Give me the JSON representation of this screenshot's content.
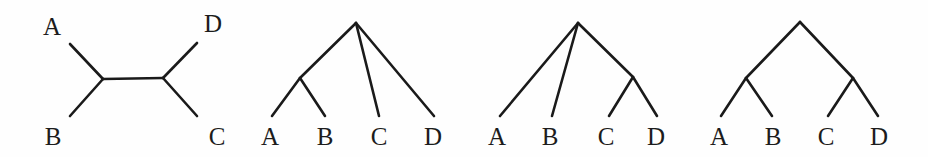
{
  "figure": {
    "name": "four-taxon-tree-diagrams",
    "background_color": "#fefefe",
    "line_color": "#1a1a1a",
    "label_color": "#1c1c1c",
    "width": 928,
    "height": 157
  },
  "trees": [
    {
      "id": "tree-unrooted",
      "type": "unrooted-four-taxon-tree",
      "description": "Unrooted tree with internal edge separating (A,B) from (C,D)",
      "labels": [
        {
          "text": "A",
          "x": 52,
          "y": 35
        },
        {
          "text": "B",
          "x": 53,
          "y": 145
        },
        {
          "text": "D",
          "x": 213,
          "y": 32
        },
        {
          "text": "C",
          "x": 217,
          "y": 145
        }
      ],
      "nodes": [
        {
          "name": "internal-left",
          "x": 103,
          "y": 79
        },
        {
          "name": "internal-right",
          "x": 163,
          "y": 78
        }
      ],
      "edges": [
        {
          "name": "edge-A",
          "x1": 70,
          "y1": 44,
          "x2": 103,
          "y2": 79
        },
        {
          "name": "edge-B",
          "x1": 70,
          "y1": 116,
          "x2": 103,
          "y2": 79
        },
        {
          "name": "edge-internal",
          "x1": 103,
          "y1": 79,
          "x2": 163,
          "y2": 78
        },
        {
          "name": "edge-D",
          "x1": 163,
          "y1": 78,
          "x2": 197,
          "y2": 43
        },
        {
          "name": "edge-C",
          "x1": 163,
          "y1": 78,
          "x2": 197,
          "y2": 116
        }
      ]
    },
    {
      "id": "tree-rooted-ab",
      "type": "rooted-four-taxon-tree",
      "description": "Rooted tree with (A,B) clade; C and D attach directly to root",
      "labels": [
        {
          "text": "A",
          "x": 270,
          "y": 145
        },
        {
          "text": "B",
          "x": 325,
          "y": 145
        },
        {
          "text": "C",
          "x": 379,
          "y": 145
        },
        {
          "text": "D",
          "x": 433,
          "y": 145
        }
      ],
      "nodes": [
        {
          "name": "root",
          "x": 356,
          "y": 23
        },
        {
          "name": "internal-ab",
          "x": 300,
          "y": 78
        }
      ],
      "edges": [
        {
          "name": "edge-root-ab",
          "x1": 356,
          "y1": 23,
          "x2": 300,
          "y2": 78
        },
        {
          "name": "edge-A",
          "x1": 300,
          "y1": 78,
          "x2": 272,
          "y2": 116
        },
        {
          "name": "edge-B",
          "x1": 300,
          "y1": 78,
          "x2": 325,
          "y2": 116
        },
        {
          "name": "edge-C",
          "x1": 356,
          "y1": 23,
          "x2": 379,
          "y2": 116
        },
        {
          "name": "edge-D",
          "x1": 356,
          "y1": 23,
          "x2": 434,
          "y2": 116
        }
      ]
    },
    {
      "id": "tree-rooted-cd",
      "type": "rooted-four-taxon-tree",
      "description": "Rooted tree with (C,D) clade; A and B attach directly to root",
      "labels": [
        {
          "text": "A",
          "x": 497,
          "y": 145
        },
        {
          "text": "B",
          "x": 550,
          "y": 145
        },
        {
          "text": "C",
          "x": 606,
          "y": 145
        },
        {
          "text": "D",
          "x": 656,
          "y": 145
        }
      ],
      "nodes": [
        {
          "name": "root",
          "x": 578,
          "y": 23
        },
        {
          "name": "internal-cd",
          "x": 633,
          "y": 77
        }
      ],
      "edges": [
        {
          "name": "edge-A",
          "x1": 578,
          "y1": 23,
          "x2": 500,
          "y2": 116
        },
        {
          "name": "edge-B",
          "x1": 578,
          "y1": 23,
          "x2": 552,
          "y2": 116
        },
        {
          "name": "edge-root-cd",
          "x1": 578,
          "y1": 23,
          "x2": 633,
          "y2": 77
        },
        {
          "name": "edge-C",
          "x1": 633,
          "y1": 77,
          "x2": 609,
          "y2": 116
        },
        {
          "name": "edge-D",
          "x1": 633,
          "y1": 77,
          "x2": 657,
          "y2": 116
        }
      ]
    },
    {
      "id": "tree-rooted-balanced",
      "type": "rooted-four-taxon-tree",
      "description": "Balanced rooted tree with (A,B) and (C,D) clades",
      "labels": [
        {
          "text": "A",
          "x": 719,
          "y": 145
        },
        {
          "text": "B",
          "x": 773,
          "y": 145
        },
        {
          "text": "C",
          "x": 826,
          "y": 145
        },
        {
          "text": "D",
          "x": 879,
          "y": 145
        }
      ],
      "nodes": [
        {
          "name": "root",
          "x": 800,
          "y": 22
        },
        {
          "name": "internal-ab",
          "x": 746,
          "y": 78
        },
        {
          "name": "internal-cd",
          "x": 853,
          "y": 78
        }
      ],
      "edges": [
        {
          "name": "edge-root-ab",
          "x1": 800,
          "y1": 22,
          "x2": 746,
          "y2": 78
        },
        {
          "name": "edge-root-cd",
          "x1": 800,
          "y1": 22,
          "x2": 853,
          "y2": 78
        },
        {
          "name": "edge-A",
          "x1": 746,
          "y1": 78,
          "x2": 721,
          "y2": 116
        },
        {
          "name": "edge-B",
          "x1": 746,
          "y1": 78,
          "x2": 772,
          "y2": 116
        },
        {
          "name": "edge-C",
          "x1": 853,
          "y1": 78,
          "x2": 828,
          "y2": 116
        },
        {
          "name": "edge-D",
          "x1": 853,
          "y1": 78,
          "x2": 878,
          "y2": 116
        }
      ]
    }
  ]
}
